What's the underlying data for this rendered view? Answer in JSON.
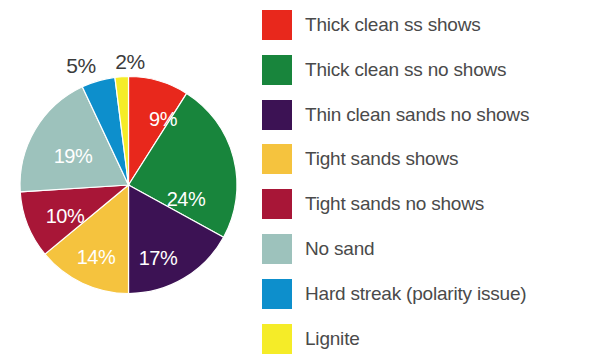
{
  "chart_data": {
    "type": "pie",
    "title": "",
    "categories": [
      "Thick clean ss shows",
      "Thick clean ss no shows",
      "Thin clean sands no shows",
      "Tight sands shows",
      "Tight sands no shows",
      "No sand",
      "Hard streak (polarity issue)",
      "Lignite"
    ],
    "values": [
      9,
      24,
      17,
      14,
      10,
      19,
      5,
      2
    ],
    "value_labels": [
      "9%",
      "24%",
      "17%",
      "14%",
      "10%",
      "19%",
      "5%",
      "2%"
    ],
    "colors": [
      "#e8281c",
      "#18853c",
      "#3c1254",
      "#f5c33e",
      "#a81637",
      "#9dc2bc",
      "#0d8fcc",
      "#f5ec28"
    ],
    "label_placement": [
      "inside",
      "inside",
      "inside",
      "inside",
      "inside",
      "inside",
      "outside",
      "outside"
    ],
    "inside_label_color": "#ffffff",
    "outside_label_color": "#3b3b3b",
    "start_angle_deg": 0,
    "direction": "clockwise",
    "legend_position": "right",
    "grid": false,
    "xlabel": "",
    "ylabel": ""
  },
  "legend": {
    "items": [
      {
        "label": "Thick clean ss shows",
        "color": "#e8281c"
      },
      {
        "label": "Thick clean ss no shows",
        "color": "#18853c"
      },
      {
        "label": "Thin clean sands no shows",
        "color": "#3c1254"
      },
      {
        "label": "Tight sands shows",
        "color": "#f5c33e"
      },
      {
        "label": "Tight sands no shows",
        "color": "#a81637"
      },
      {
        "label": "No sand",
        "color": "#9dc2bc"
      },
      {
        "label": "Hard streak (polarity issue)",
        "color": "#0d8fcc"
      },
      {
        "label": "Lignite",
        "color": "#f5ec28"
      }
    ]
  },
  "pie_labels": {
    "inside": [
      {
        "text": "9%",
        "x": 163,
        "y": 119
      },
      {
        "text": "24%",
        "x": 186,
        "y": 199
      },
      {
        "text": "17%",
        "x": 158,
        "y": 258
      },
      {
        "text": "14%",
        "x": 96,
        "y": 257
      },
      {
        "text": "10%",
        "x": 65,
        "y": 216
      },
      {
        "text": "19%",
        "x": 73,
        "y": 156
      }
    ],
    "outside": [
      {
        "text": "5%",
        "x": 81,
        "y": 65
      },
      {
        "text": "2%",
        "x": 130,
        "y": 61
      }
    ]
  }
}
